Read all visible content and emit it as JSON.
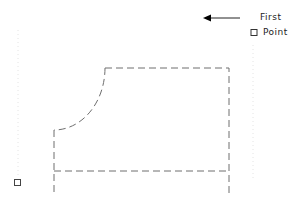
{
  "diagram": {
    "annotation": {
      "line1": "First",
      "line2": "Point"
    },
    "colors": {
      "outline": "#6e6e6e",
      "guide": "#e6e6e6",
      "text": "#222222",
      "arrow": "#000000"
    }
  }
}
